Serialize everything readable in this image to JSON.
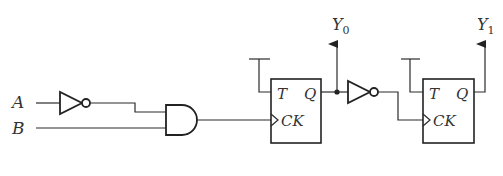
{
  "diagram": {
    "type": "logic-circuit",
    "inputs": [
      {
        "name": "A",
        "label": "A"
      },
      {
        "name": "B",
        "label": "B"
      }
    ],
    "gates": [
      {
        "id": "not1",
        "type": "NOT",
        "input": "A"
      },
      {
        "id": "and1",
        "type": "AND",
        "inputs": [
          "not1",
          "B"
        ]
      },
      {
        "id": "not2",
        "type": "NOT",
        "input": "ff1.Q"
      }
    ],
    "flipflops": [
      {
        "id": "ff1",
        "type": "T",
        "pin_t": "T",
        "pin_q": "Q",
        "pin_ck": "CK",
        "clock_from": "and1",
        "t_input": "high"
      },
      {
        "id": "ff2",
        "type": "T",
        "pin_t": "T",
        "pin_q": "Q",
        "pin_ck": "CK",
        "clock_from": "not2",
        "t_input": "high"
      }
    ],
    "outputs": [
      {
        "name": "Y0",
        "base": "Y",
        "sub": "0",
        "from": "ff1.Q"
      },
      {
        "name": "Y1",
        "base": "Y",
        "sub": "1",
        "from": "ff2.Q"
      }
    ]
  }
}
